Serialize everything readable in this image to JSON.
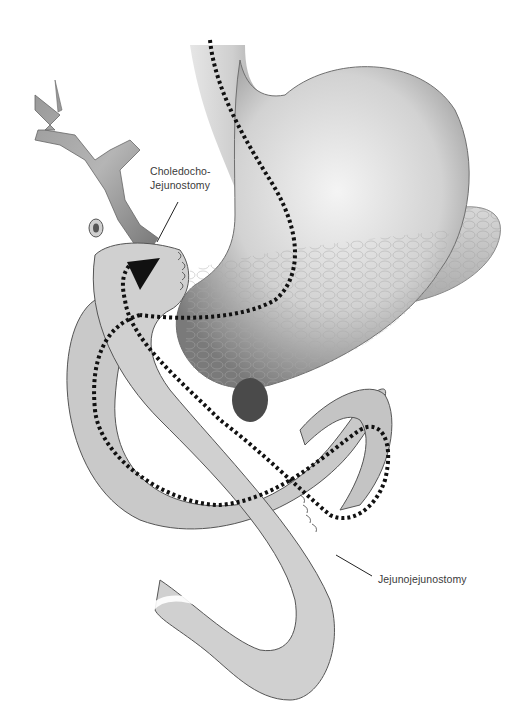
{
  "figure": {
    "type": "anatomical-illustration",
    "labels": [
      {
        "id": "choledochojejunostomy",
        "lines": [
          "Choledocho-",
          "Jejunostomy"
        ]
      },
      {
        "id": "jejunojejunostomy",
        "lines": [
          "Jejunojejunostomy"
        ]
      }
    ],
    "structures": [
      "bile-duct",
      "stomach",
      "esophagus",
      "pancreas",
      "jejunum-roux-limb",
      "jejunum-loop"
    ],
    "colors": {
      "background": "#ffffff",
      "organ_light": "#eeeeee",
      "organ_mid": "#bdbdbd",
      "organ_dark": "#6e6e6e",
      "dotted_path": "#111111",
      "label_text": "#3a3a3a"
    }
  }
}
